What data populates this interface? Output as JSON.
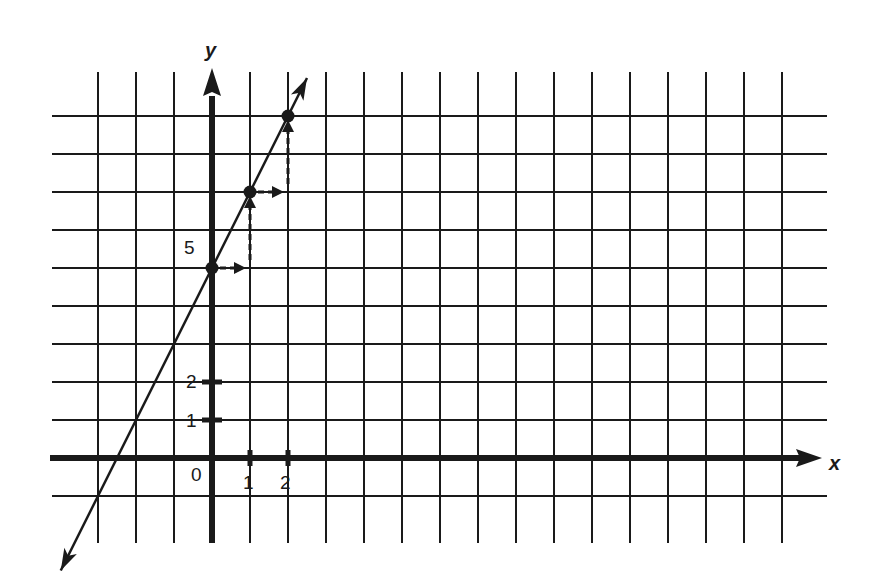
{
  "chart_data": {
    "type": "line",
    "title": "",
    "xlabel": "x",
    "ylabel": "y",
    "equation": "y = 2x + 5",
    "slope": 2,
    "y_intercept": 5,
    "x": [
      0,
      1,
      2
    ],
    "values": [
      5,
      7,
      9
    ],
    "points": [
      {
        "x": 0,
        "y": 5
      },
      {
        "x": 1,
        "y": 7
      },
      {
        "x": 2,
        "y": 9
      }
    ],
    "step_arrows": [
      {
        "from": [
          0,
          5
        ],
        "to": [
          1,
          5
        ],
        "direction": "right"
      },
      {
        "from": [
          1,
          5
        ],
        "to": [
          1,
          7
        ],
        "direction": "up"
      },
      {
        "from": [
          1,
          7
        ],
        "to": [
          2,
          7
        ],
        "direction": "right"
      },
      {
        "from": [
          2,
          7
        ],
        "to": [
          2,
          9
        ],
        "direction": "up"
      }
    ],
    "x_tick_labels": [
      "0",
      "1",
      "2"
    ],
    "y_tick_labels": [
      "1",
      "2",
      "5"
    ],
    "xlim": [
      -3,
      15
    ],
    "ylim": [
      -1,
      9
    ],
    "grid": true,
    "legend": null
  },
  "labels": {
    "x_axis": "x",
    "y_axis": "y",
    "origin": "0",
    "x1": "1",
    "x2": "2",
    "y1": "1",
    "y2": "2",
    "y5": "5"
  },
  "colors": {
    "ink": "#1a1a1a",
    "paper": "#ffffff"
  }
}
